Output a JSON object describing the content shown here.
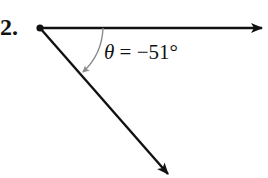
{
  "problem": {
    "number": "2."
  },
  "angle": {
    "symbol": "θ",
    "equals": " = ",
    "value": "−51°",
    "degrees": -51
  },
  "colors": {
    "rays": "#111111",
    "arc": "#8a8a8a",
    "text": "#111111"
  }
}
